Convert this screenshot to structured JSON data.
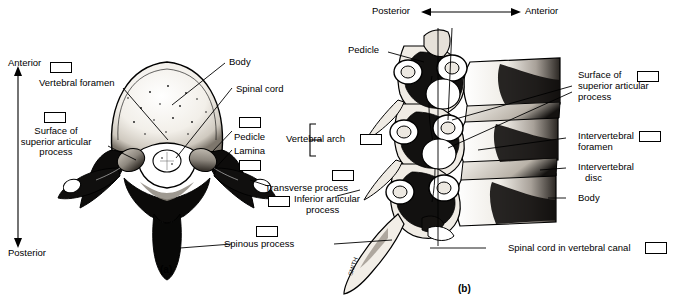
{
  "figure": {
    "panels": [
      {
        "id": "a",
        "caption": "(a)",
        "view": "superior view of a vertebra"
      },
      {
        "id": "b",
        "caption": "(b)",
        "view": "lateral view of stacked cervical vertebrae"
      }
    ]
  },
  "orientation": {
    "left_panel": {
      "top_label": "Anterior",
      "bottom_label": "Posterior",
      "axis": "vertical double arrow"
    },
    "right_panel": {
      "left_label": "Posterior",
      "right_label": "Anterior",
      "axis": "horizontal double arrow"
    }
  },
  "labels_left": [
    {
      "name": "vertebral-foramen",
      "text": "Vertebral foramen",
      "checkbox": true
    },
    {
      "name": "surface-of-superior-articular-process",
      "text": "Surface of superior articular process",
      "checkbox": true
    },
    {
      "name": "body",
      "text": "Body",
      "checkbox": false
    },
    {
      "name": "spinal-cord",
      "text": "Spinal cord",
      "checkbox": false
    },
    {
      "name": "pedicle",
      "text": "Pedicle",
      "checkbox": true
    },
    {
      "name": "lamina",
      "text": "Lamina",
      "checkbox": true
    },
    {
      "name": "vertebral-arch",
      "text": "Vertebral arch",
      "checkbox": true
    },
    {
      "name": "transverse-process",
      "text": "Transverse process",
      "checkbox": true
    },
    {
      "name": "inferior-articular-process",
      "text": "Inferior articular process",
      "checkbox": true
    },
    {
      "name": "spinous-process",
      "text": "Spinous process",
      "checkbox": true
    }
  ],
  "labels_right": [
    {
      "name": "pedicle-lateral",
      "text": "Pedicle",
      "checkbox": false
    },
    {
      "name": "surface-of-superior-articular-process-lateral",
      "text": "Surface of superior articular process",
      "checkbox": true
    },
    {
      "name": "intervertebral-foramen",
      "text": "Intervertebral foramen",
      "checkbox": true
    },
    {
      "name": "intervertebral-disc",
      "text": "Intervertebral disc",
      "checkbox": false
    },
    {
      "name": "body-lateral",
      "text": "Body",
      "checkbox": false
    },
    {
      "name": "spinal-cord-in-vertebral-canal",
      "text": "Spinal cord in vertebral canal",
      "checkbox": true
    }
  ],
  "text": {
    "anterior": "Anterior",
    "posterior": "Posterior",
    "vertebral_foramen": "Vertebral foramen",
    "surface_of": "Surface of",
    "superior_articular": "superior articular",
    "process": "process",
    "body": "Body",
    "spinal_cord": "Spinal cord",
    "pedicle": "Pedicle",
    "lamina": "Lamina",
    "vertebral_arch": "Vertebral arch",
    "transverse_process": "Transverse process",
    "inferior_articular": "Inferior articular",
    "spinous_process": "Spinous process",
    "intervertebral": "Intervertebral",
    "foramen": "foramen",
    "disc": "disc",
    "spinal_cord_in_vertebral_canal": "Spinal cord in vertebral canal",
    "caption_a": "(a)",
    "caption_b": "(b)",
    "artist_mark": "SMITH"
  },
  "colors": {
    "ink": "#000000",
    "background": "#ffffff",
    "bone_light": "#e8e4dc",
    "bone_mid": "#9a948c",
    "bone_dark": "#1a1a1a"
  }
}
